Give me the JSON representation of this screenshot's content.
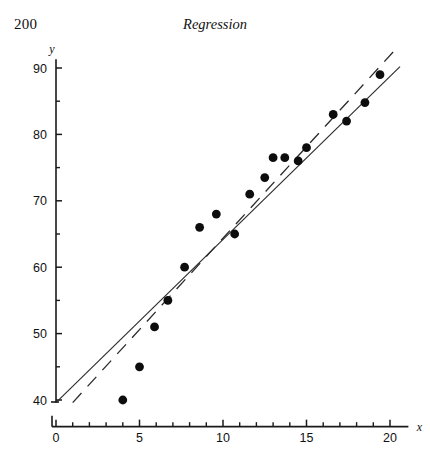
{
  "running_head": {
    "page_number": "200",
    "title": "Regression"
  },
  "chart_data": {
    "type": "scatter",
    "title": "",
    "xlabel": "x",
    "ylabel": "y",
    "xlim": [
      0,
      21.2
    ],
    "ylim": [
      38.8,
      91.5
    ],
    "grid": false,
    "legend": "none",
    "x_ticks_major": [
      0,
      5,
      10,
      15,
      20
    ],
    "x_ticks_minor": [
      1,
      2,
      3,
      4,
      6,
      7,
      8,
      9,
      11,
      12,
      13,
      14,
      16,
      17,
      18,
      19
    ],
    "y_ticks_major": [
      40,
      50,
      60,
      70,
      80,
      90
    ],
    "y_ticks_minor": [
      45,
      55,
      65,
      75,
      85
    ],
    "x": [
      4.0,
      5.0,
      5.9,
      6.7,
      7.7,
      8.6,
      9.6,
      10.7,
      11.6,
      12.5,
      13.0,
      13.7,
      14.5,
      15.0,
      16.6,
      17.4,
      18.5,
      19.4
    ],
    "y": [
      40.0,
      45.0,
      51.0,
      55.0,
      60.0,
      66.0,
      68.0,
      65.0,
      71.0,
      73.5,
      76.5,
      76.5,
      76.0,
      78.0,
      83.0,
      82.0,
      84.8,
      89.0
    ],
    "points": [
      {
        "x": 4.0,
        "y": 40.0
      },
      {
        "x": 5.0,
        "y": 45.0
      },
      {
        "x": 5.9,
        "y": 51.0
      },
      {
        "x": 6.7,
        "y": 55.0
      },
      {
        "x": 7.7,
        "y": 60.0
      },
      {
        "x": 8.6,
        "y": 66.0
      },
      {
        "x": 9.6,
        "y": 68.0
      },
      {
        "x": 10.7,
        "y": 65.0
      },
      {
        "x": 11.6,
        "y": 71.0
      },
      {
        "x": 12.5,
        "y": 73.5
      },
      {
        "x": 13.0,
        "y": 76.5
      },
      {
        "x": 13.7,
        "y": 76.5
      },
      {
        "x": 14.5,
        "y": 76.0
      },
      {
        "x": 15.0,
        "y": 78.0
      },
      {
        "x": 16.6,
        "y": 83.0
      },
      {
        "x": 17.4,
        "y": 82.0
      },
      {
        "x": 18.5,
        "y": 84.8
      },
      {
        "x": 19.4,
        "y": 89.0
      }
    ],
    "series": [
      {
        "name": "solid-regression-line",
        "style": "solid",
        "x_start": 0.0,
        "y_start": 39.6,
        "x_end": 20.6,
        "y_end": 90.2
      },
      {
        "name": "dashed-regression-line",
        "style": "dashed",
        "x_start": 1.0,
        "y_start": 39.6,
        "x_end": 20.4,
        "y_end": 93.0
      }
    ]
  }
}
